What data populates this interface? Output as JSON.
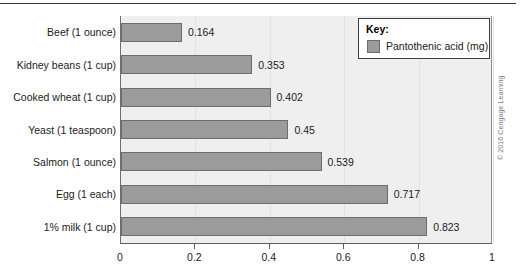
{
  "chart_data": {
    "type": "bar",
    "orientation": "horizontal",
    "title": "",
    "xlabel": "",
    "ylabel": "",
    "xlim": [
      0,
      1
    ],
    "xticks": [
      "0",
      "0.2",
      "0.4",
      "0.6",
      "0.8",
      "1"
    ],
    "xtick_values": [
      0,
      0.2,
      0.4,
      0.6,
      0.8,
      1
    ],
    "grid": true,
    "legend_position": "top-right",
    "legend_title": "Key:",
    "categories": [
      "Beef (1 ounce)",
      "Kidney beans (1 cup)",
      "Cooked wheat (1 cup)",
      "Yeast (1 teaspoon)",
      "Salmon (1 ounce)",
      "Egg (1 each)",
      "1% milk (1 cup)"
    ],
    "values": [
      0.164,
      0.353,
      0.402,
      0.45,
      0.539,
      0.717,
      0.823
    ],
    "value_labels": [
      "0.164",
      "0.353",
      "0.402",
      "0.45",
      "0.539",
      "0.717",
      "0.823"
    ],
    "series": [
      {
        "name": "Pantothenic acid (mg)",
        "values": [
          0.164,
          0.353,
          0.402,
          0.45,
          0.539,
          0.717,
          0.823
        ]
      }
    ]
  },
  "legend": {
    "title": "Key:",
    "entries": [
      {
        "label": "Pantothenic acid (mg)",
        "color": "#9b9b9b"
      }
    ]
  },
  "credit": "© 2016 Cengage Learning",
  "colors": {
    "bar_fill": "#9b9b9b",
    "bar_border": "#6d6d6d",
    "plot_background": "#efefef",
    "gridline": "#e2e2e2",
    "axis": "#5d5d5d",
    "text": "#1b1b1b"
  }
}
